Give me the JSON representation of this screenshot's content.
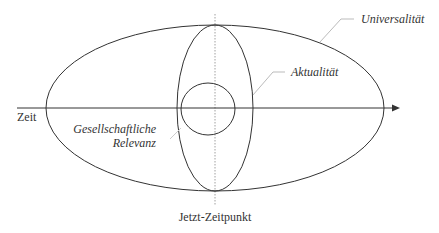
{
  "diagram": {
    "labels": {
      "universal": "Universalität",
      "aktual": "Aktualität",
      "relevanz_line1": "Gesellschaftliche",
      "relevanz_line2": "Relevanz",
      "time_axis": "Zeit",
      "now_point": "Jetzt-Zeitpunkt"
    },
    "colors": {
      "stroke": "#333333",
      "leader": "#bbbbbb",
      "dotted": "#888888",
      "text": "#333333"
    }
  }
}
